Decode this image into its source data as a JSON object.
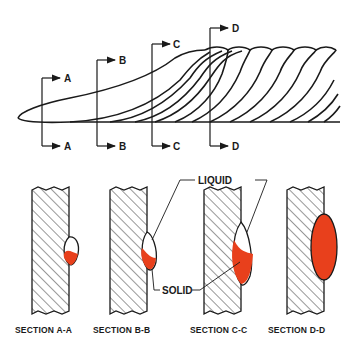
{
  "diagram": {
    "type": "weld bead cross-section illustration",
    "colors": {
      "line": "#1a1a1a",
      "molten": "#e8401c",
      "background": "#ffffff"
    },
    "section_markers": [
      {
        "id": "A",
        "top_label": "A",
        "bottom_label": "A"
      },
      {
        "id": "B",
        "top_label": "B",
        "bottom_label": "B"
      },
      {
        "id": "C",
        "top_label": "C",
        "bottom_label": "C"
      },
      {
        "id": "D",
        "top_label": "D",
        "bottom_label": "D"
      }
    ],
    "callouts": {
      "liquid": "LIQUID",
      "solid": "SOLID"
    },
    "sections": [
      {
        "caption": "SECTION A-A"
      },
      {
        "caption": "SECTION B-B"
      },
      {
        "caption": "SECTION C-C"
      },
      {
        "caption": "SECTION D-D"
      }
    ]
  }
}
